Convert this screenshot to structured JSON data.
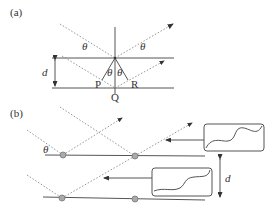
{
  "panel_a": {
    "label": "(a)",
    "angle_labels": [
      "θ",
      "θ",
      "θ",
      "θ"
    ],
    "spacing_label": "d",
    "points": {
      "P": "P",
      "Q": "Q",
      "R": "R"
    }
  },
  "panel_b": {
    "label": "(b)",
    "angle_label": "θ",
    "spacing_label": "d"
  }
}
